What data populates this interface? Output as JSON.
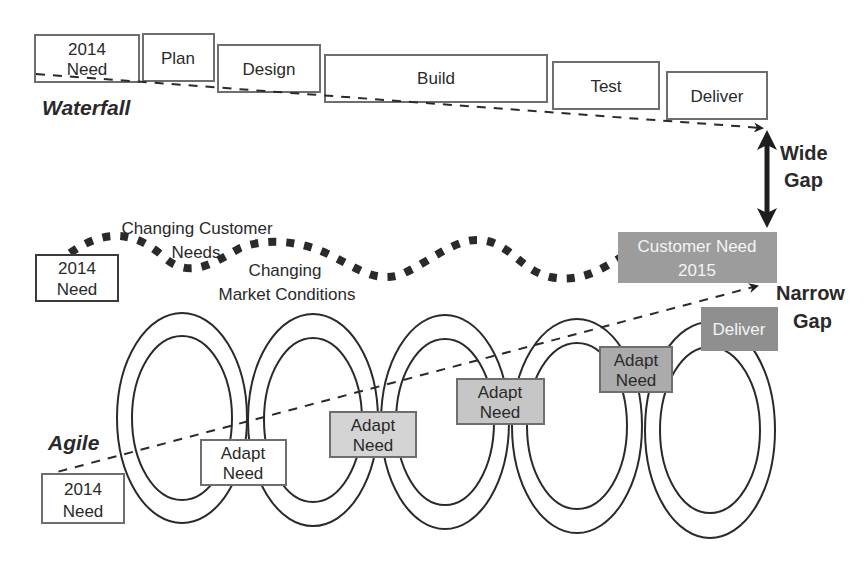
{
  "colors": {
    "ink": "#2a2a2a",
    "box_border": "#6e6e6e",
    "fill_light": "#d4d4d4",
    "fill_mid": "#bdbdbd",
    "fill_dark": "#9c9c9c",
    "fill_darkest": "#8f8f8f",
    "white_text": "#f4f4f4"
  },
  "waterfall": {
    "label": "Waterfall",
    "boxes": [
      {
        "line1": "2014",
        "line2": "Need",
        "x": 35,
        "y": 35,
        "w": 104,
        "h": 47
      },
      {
        "line1": "Plan",
        "line2": "",
        "x": 143,
        "y": 34,
        "w": 71,
        "h": 47
      },
      {
        "line1": "Design",
        "line2": "",
        "x": 218,
        "y": 45,
        "w": 102,
        "h": 47
      },
      {
        "line1": "Build",
        "line2": "",
        "x": 325,
        "y": 55,
        "w": 222,
        "h": 47
      },
      {
        "line1": "Test",
        "line2": "",
        "x": 553,
        "y": 62,
        "w": 106,
        "h": 47
      },
      {
        "line1": "Deliver",
        "line2": "",
        "x": 667,
        "y": 72,
        "w": 100,
        "h": 47
      }
    ]
  },
  "gaps": {
    "wide": {
      "line1": "Wide",
      "line2": "Gap"
    },
    "narrow": {
      "line1": "Narrow",
      "line2": "Gap"
    }
  },
  "market": {
    "need_box": {
      "line1": "2014",
      "line2": "Need"
    },
    "label_customer_line1": "Changing Customer",
    "label_customer_line2": "Needs",
    "label_market_line1": "Changing",
    "label_market_line2": "Market Conditions",
    "customer_need_box": {
      "line1": "Customer Need",
      "line2": "2015"
    }
  },
  "agile": {
    "label": "Agile",
    "start_box": {
      "line1": "2014",
      "line2": "Need"
    },
    "adapt_boxes": [
      {
        "line1": "Adapt",
        "line2": "Need",
        "shade": "white"
      },
      {
        "line1": "Adapt",
        "line2": "Need",
        "shade": "light"
      },
      {
        "line1": "Adapt",
        "line2": "Need",
        "shade": "mid"
      },
      {
        "line1": "Adapt",
        "line2": "Need",
        "shade": "dark"
      }
    ],
    "deliver_box": {
      "label": "Deliver"
    }
  }
}
